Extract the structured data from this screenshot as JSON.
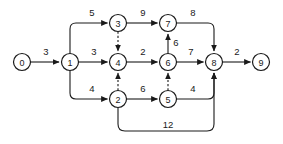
{
  "diagram": {
    "type": "directed-weighted-graph",
    "colors": {
      "background": "#ffffff",
      "stroke": "#1a1a1a",
      "node_fill": "#ffffff"
    },
    "nodes": [
      {
        "id": "0",
        "label": "0",
        "cx": 22,
        "cy": 62,
        "r": 8.5
      },
      {
        "id": "1",
        "label": "1",
        "cx": 70,
        "cy": 62,
        "r": 8.5
      },
      {
        "id": "2",
        "label": "2",
        "cx": 118,
        "cy": 99,
        "r": 8.5
      },
      {
        "id": "3",
        "label": "3",
        "cx": 118,
        "cy": 23,
        "r": 8.5
      },
      {
        "id": "4",
        "label": "4",
        "cx": 118,
        "cy": 62,
        "r": 8.5
      },
      {
        "id": "5",
        "label": "5",
        "cx": 168,
        "cy": 99,
        "r": 8.5
      },
      {
        "id": "6",
        "label": "6",
        "cx": 168,
        "cy": 62,
        "r": 8.5
      },
      {
        "id": "7",
        "label": "7",
        "cx": 168,
        "cy": 23,
        "r": 8.5
      },
      {
        "id": "8",
        "label": "8",
        "cx": 214,
        "cy": 62,
        "r": 8.5
      },
      {
        "id": "9",
        "label": "9",
        "cx": 261,
        "cy": 62,
        "r": 8.5
      }
    ],
    "edges": [
      {
        "id": "e-0-4-1",
        "from": "0",
        "to": "1",
        "weight": "3",
        "style": "solid",
        "label_x": 46,
        "label_y": 51,
        "path": "M 30.5 62 L 59 62"
      },
      {
        "id": "e-1-to-3",
        "from": "1",
        "to": "3",
        "weight": "5",
        "style": "solid",
        "label_x": 92,
        "label_y": 12,
        "path": "M 70 53.5 L 70 29 Q 70 23 76 23 L 107.5 23"
      },
      {
        "id": "e-1-to-4",
        "from": "1",
        "to": "4",
        "weight": "3",
        "style": "solid",
        "label_x": 94,
        "label_y": 51,
        "path": "M 78.5 62 L 107.5 62"
      },
      {
        "id": "e-1-to-2",
        "from": "1",
        "to": "2",
        "weight": "4",
        "style": "solid",
        "label_x": 92,
        "label_y": 88,
        "path": "M 70 70.5 L 70 93 Q 70 99 76 99 L 107.5 99"
      },
      {
        "id": "e-3-to-7",
        "from": "3",
        "to": "7",
        "weight": "9",
        "style": "solid",
        "label_x": 143,
        "label_y": 12,
        "path": "M 126.5 23 L 157.5 23"
      },
      {
        "id": "e-3-to-4",
        "from": "3",
        "to": "4",
        "weight": "",
        "style": "dashed",
        "label_x": 0,
        "label_y": 0,
        "path": "M 118 31.5 L 118 51"
      },
      {
        "id": "e-4-to-6",
        "from": "4",
        "to": "6",
        "weight": "2",
        "style": "solid",
        "label_x": 143,
        "label_y": 51,
        "path": "M 126.5 62 L 157.5 62"
      },
      {
        "id": "e-2-to-4",
        "from": "2",
        "to": "4",
        "weight": "",
        "style": "dashed",
        "label_x": 0,
        "label_y": 0,
        "path": "M 118 90.5 L 118 73"
      },
      {
        "id": "e-2-to-5",
        "from": "2",
        "to": "5",
        "weight": "6",
        "style": "solid",
        "label_x": 143,
        "label_y": 88,
        "path": "M 126.5 99 L 157.5 99"
      },
      {
        "id": "e-7-to-8",
        "from": "7",
        "to": "8",
        "weight": "8",
        "style": "solid",
        "label_x": 193,
        "label_y": 12,
        "path": "M 176.5 23 L 208 23 Q 214 23 214 29 L 214 51"
      },
      {
        "id": "e-6-to-7",
        "from": "6",
        "to": "7",
        "weight": "6",
        "style": "solid",
        "label_x": 176,
        "label_y": 42,
        "path": "M 168 53.5 L 168 34"
      },
      {
        "id": "e-6-to-8",
        "from": "6",
        "to": "8",
        "weight": "7",
        "style": "solid",
        "label_x": 191,
        "label_y": 51,
        "path": "M 176.5 62 L 203.5 62"
      },
      {
        "id": "e-5-to-6",
        "from": "5",
        "to": "6",
        "weight": "",
        "style": "dashed",
        "label_x": 0,
        "label_y": 0,
        "path": "M 168 90.5 L 168 73"
      },
      {
        "id": "e-5-to-8",
        "from": "5",
        "to": "8",
        "weight": "4",
        "style": "solid",
        "label_x": 193,
        "label_y": 88,
        "path": "M 176.5 99 L 208 99 Q 214 99 214 93 L 214 73"
      },
      {
        "id": "e-8-to-9",
        "from": "8",
        "to": "9",
        "weight": "2",
        "style": "solid",
        "label_x": 237,
        "label_y": 51,
        "path": "M 222.5 62 L 250.5 62"
      },
      {
        "id": "e-2-to-8",
        "from": "2",
        "to": "8",
        "weight": "12",
        "style": "solid",
        "label_x": 168,
        "label_y": 124,
        "path": "M 118 107.5 L 118 124 Q 118 131 125 131 L 207 131 Q 214 131 214 124 L 214 73"
      }
    ]
  }
}
